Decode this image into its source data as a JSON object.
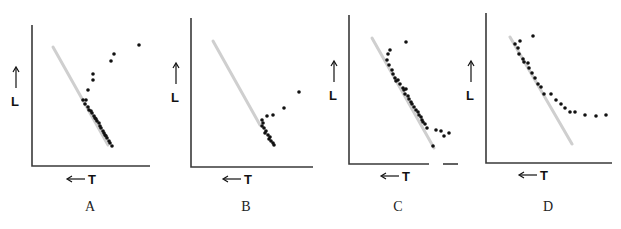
{
  "figure": {
    "axis_labels": {
      "y": "L",
      "x": "T"
    },
    "colors": {
      "axis": "#3a3a3a",
      "reference_line": "#cfcfcf",
      "dots": "#111111",
      "background": "#ffffff"
    },
    "panels": [
      {
        "caption": "A"
      },
      {
        "caption": "B"
      },
      {
        "caption": "C"
      },
      {
        "caption": "D"
      }
    ]
  },
  "chart_data": [
    {
      "type": "scatter",
      "title": "A",
      "xlabel": "← T",
      "ylabel": "↑ L",
      "reference_line": {
        "from": [
          53,
          47
        ],
        "to": [
          108,
          145
        ],
        "color": "#cfcfcf"
      },
      "points_px": [
        [
          83,
          100
        ],
        [
          86,
          100
        ],
        [
          85,
          104
        ],
        [
          88,
          107
        ],
        [
          89,
          110
        ],
        [
          92,
          113
        ],
        [
          91,
          111
        ],
        [
          94,
          116
        ],
        [
          95,
          118
        ],
        [
          97,
          121
        ],
        [
          96,
          119
        ],
        [
          99,
          123
        ],
        [
          100,
          126
        ],
        [
          101,
          128
        ],
        [
          103,
          131
        ],
        [
          104,
          133
        ],
        [
          105,
          135
        ],
        [
          107,
          138
        ],
        [
          106,
          136
        ],
        [
          109,
          141
        ],
        [
          110,
          143
        ],
        [
          112,
          146
        ],
        [
          88,
          90
        ],
        [
          93,
          80
        ],
        [
          93,
          74
        ],
        [
          111,
          61
        ],
        [
          114,
          54
        ],
        [
          139,
          45
        ]
      ],
      "grid": false
    },
    {
      "type": "scatter",
      "title": "B",
      "xlabel": "← T",
      "ylabel": "↑ L",
      "reference_line": {
        "from": [
          213,
          41
        ],
        "to": [
          260,
          125
        ],
        "color": "#cfcfcf"
      },
      "points_px": [
        [
          262,
          120
        ],
        [
          263,
          123
        ],
        [
          262,
          126
        ],
        [
          264,
          128
        ],
        [
          266,
          131
        ],
        [
          265,
          133
        ],
        [
          268,
          135
        ],
        [
          270,
          137
        ],
        [
          269,
          139
        ],
        [
          271,
          141
        ],
        [
          273,
          143
        ],
        [
          274,
          145
        ],
        [
          267,
          116
        ],
        [
          273,
          115
        ],
        [
          284,
          108
        ],
        [
          299,
          92
        ]
      ],
      "grid": false
    },
    {
      "type": "scatter",
      "title": "C",
      "xlabel": "← T",
      "ylabel": "↑ L",
      "reference_line": {
        "from": [
          372,
          38
        ],
        "to": [
          434,
          148
        ],
        "color": "#cfcfcf"
      },
      "points_px": [
        [
          390,
          50
        ],
        [
          388,
          54
        ],
        [
          387,
          60
        ],
        [
          389,
          65
        ],
        [
          392,
          70
        ],
        [
          393,
          74
        ],
        [
          395,
          78
        ],
        [
          396,
          81
        ],
        [
          398,
          80
        ],
        [
          400,
          84
        ],
        [
          403,
          88
        ],
        [
          404,
          90
        ],
        [
          406,
          89
        ],
        [
          405,
          94
        ],
        [
          408,
          96
        ],
        [
          409,
          99
        ],
        [
          411,
          102
        ],
        [
          412,
          104
        ],
        [
          414,
          107
        ],
        [
          416,
          110
        ],
        [
          418,
          112
        ],
        [
          419,
          115
        ],
        [
          421,
          117
        ],
        [
          422,
          120
        ],
        [
          423,
          122
        ],
        [
          425,
          124
        ],
        [
          427,
          128
        ],
        [
          406,
          42
        ],
        [
          433,
          146
        ],
        [
          436,
          130
        ],
        [
          441,
          131
        ],
        [
          444,
          136
        ],
        [
          449,
          133
        ]
      ],
      "grid": false
    },
    {
      "type": "scatter",
      "title": "D",
      "xlabel": "← T",
      "ylabel": "↑ L",
      "reference_line": {
        "from": [
          510,
          37
        ],
        "to": [
          572,
          144
        ],
        "color": "#cfcfcf"
      },
      "points_px": [
        [
          515,
          44
        ],
        [
          520,
          41
        ],
        [
          518,
          48
        ],
        [
          519,
          54
        ],
        [
          523,
          59
        ],
        [
          524,
          62
        ],
        [
          528,
          63
        ],
        [
          529,
          68
        ],
        [
          532,
          73
        ],
        [
          535,
          78
        ],
        [
          538,
          84
        ],
        [
          541,
          87
        ],
        [
          544,
          94
        ],
        [
          551,
          94
        ],
        [
          556,
          100
        ],
        [
          561,
          104
        ],
        [
          565,
          108
        ],
        [
          570,
          112
        ],
        [
          575,
          112
        ],
        [
          585,
          115
        ],
        [
          596,
          116
        ],
        [
          606,
          115
        ],
        [
          533,
          36
        ]
      ],
      "grid": false
    }
  ]
}
